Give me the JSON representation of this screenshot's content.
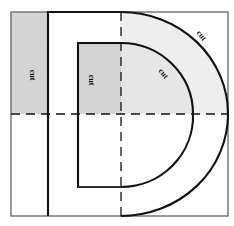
{
  "figure": {
    "frame": {
      "x": 11,
      "y": 12,
      "width": 217,
      "height": 204
    },
    "colors": {
      "shade": "#d4d4d4",
      "shade_light": "#e6e6e6",
      "line": "#111111",
      "thin_line": "#4a4a4a",
      "background": "#ffffff"
    },
    "center_lines": {
      "vertical_x": 121,
      "horizontal_y": 114,
      "style": "dashed"
    },
    "labels": [
      {
        "id": "cut-left-strip",
        "text": "cut",
        "x": 32,
        "y": 75,
        "rotation": 90
      },
      {
        "id": "cut-inner-strip",
        "text": "cut",
        "x": 91,
        "y": 80,
        "rotation": 90
      },
      {
        "id": "cut-inner-arc",
        "text": "cut",
        "x": 163,
        "y": 74,
        "rotation": 52
      },
      {
        "id": "cut-outer-arc",
        "text": "cut",
        "x": 201,
        "y": 36,
        "rotation": 52
      }
    ],
    "regions": [
      {
        "id": "left-shaded-strip",
        "shade": "dark",
        "description": "vertical rectangle left of D stem, upper half"
      },
      {
        "id": "inner-shaded-block",
        "shade": "dark",
        "description": "rectangle inside inner contour, upper half"
      },
      {
        "id": "arc-band-shaded",
        "shade": "light",
        "description": "quarter band between inner and outer arcs, upper right"
      }
    ]
  }
}
